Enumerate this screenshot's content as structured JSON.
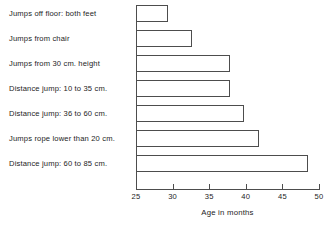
{
  "chart_data": {
    "type": "bar",
    "orientation": "horizontal",
    "title": "",
    "xlabel": "Age in months",
    "ylabel": "",
    "xlim": [
      25,
      50
    ],
    "xticks": [
      25,
      30,
      35,
      40,
      45,
      50
    ],
    "xtick_labels": [
      "25",
      "30",
      "35",
      "40",
      "45",
      "50"
    ],
    "grid": false,
    "legend": null,
    "categories": [
      "Jumps off floor:  both feet",
      "Jumps from chair",
      "Jumps from 30 cm. height",
      "Distance jump:  10 to 35 cm.",
      "Distance jump:  36 to 60 cm.",
      "Jumps rope lower than 20 cm.",
      "Distance jump:  60 to 85 cm."
    ],
    "values": [
      29.4,
      32.6,
      37.9,
      37.8,
      39.8,
      41.8,
      48.5
    ],
    "bar_fill": "#ffffff",
    "bar_edge": "#4d4d4d",
    "axis_color": "#4d4d4d",
    "text_color": "#1d1d1d",
    "background": "#ffffff"
  }
}
